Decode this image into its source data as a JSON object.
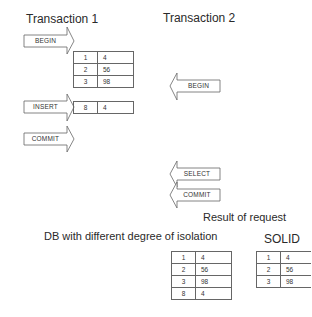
{
  "transaction1": {
    "title": "Transaction 1",
    "begin_label": "BEGIN",
    "insert_label": "INSERT",
    "commit_label": "COMMIT",
    "initial_table": [
      {
        "key": "1",
        "value": "4"
      },
      {
        "key": "2",
        "value": "56"
      },
      {
        "key": "3",
        "value": "98"
      }
    ],
    "inserted_row": {
      "key": "8",
      "value": "4"
    }
  },
  "transaction2": {
    "title": "Transaction 2",
    "begin_label": "BEGIN",
    "select_label": "SELECT",
    "commit_label": "COMMIT"
  },
  "result": {
    "title": "Result of request",
    "isolation": {
      "title": "DB with different degree of isolation",
      "rows": [
        {
          "key": "1",
          "value": "4"
        },
        {
          "key": "2",
          "value": "56"
        },
        {
          "key": "3",
          "value": "98"
        },
        {
          "key": "8",
          "value": "4"
        }
      ]
    },
    "solid": {
      "title": "SOLID",
      "rows": [
        {
          "key": "1",
          "value": "4"
        },
        {
          "key": "2",
          "value": "56"
        },
        {
          "key": "3",
          "value": "98"
        }
      ]
    }
  }
}
